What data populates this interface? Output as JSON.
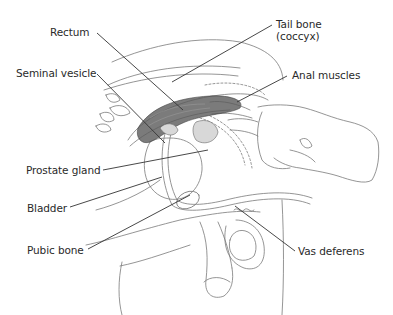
{
  "diagram": {
    "type": "anatomical-illustration",
    "top_cutoff_text": "",
    "labels": [
      {
        "id": "rectum",
        "text": "Rectum"
      },
      {
        "id": "tail-bone",
        "text": "Tail bone",
        "sub": "(coccyx)"
      },
      {
        "id": "seminal-vesicle",
        "text": "Seminal vesicle"
      },
      {
        "id": "anal-muscles",
        "text": "Anal muscles"
      },
      {
        "id": "prostate-gland",
        "text": "Prostate gland"
      },
      {
        "id": "bladder",
        "text": "Bladder"
      },
      {
        "id": "pubic-bone",
        "text": "Pubic bone"
      },
      {
        "id": "vas-deferens",
        "text": "Vas deferens"
      }
    ],
    "colors": {
      "line": "#333333",
      "sketch": "#777777",
      "shade": "#555555",
      "text": "#2a2a2a"
    }
  }
}
